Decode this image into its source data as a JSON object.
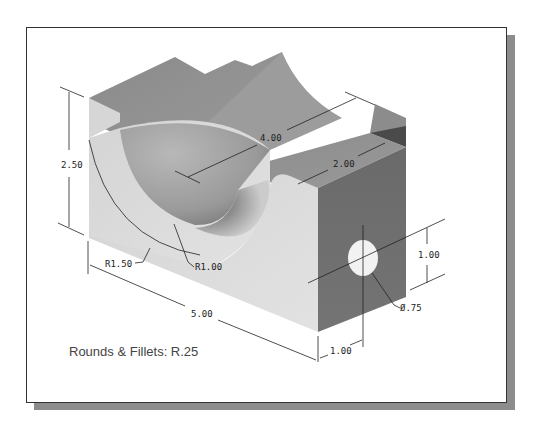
{
  "figure": {
    "type": "isometric-engineering-drawing",
    "colors": {
      "frame_border": "#333333",
      "shadow": "#8c8c8c",
      "top_face": "#8f8f8f",
      "front_face": "#d8d8d8",
      "right_face": "#6e6e6e",
      "channel_inner": "#a8a8a8",
      "dimension_line": "#222222"
    }
  },
  "dimensions": {
    "height": "2.50",
    "length": "5.00",
    "channel_length": "4.00",
    "slot_width": "2.00",
    "outer_radius": "R1.50",
    "inner_radius": "R1.00",
    "hole_vertical_offset": "1.00",
    "hole_horizontal_offset": "1.00",
    "hole_diameter": "Ø.75"
  },
  "notes": {
    "rounds_fillets": "Rounds & Fillets: R.25"
  }
}
